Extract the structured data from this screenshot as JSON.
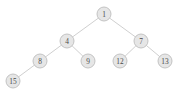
{
  "figure": {
    "type": "binary-tree-diagram",
    "background_color": "#ffffff",
    "node_fill_color": "#e6e6e6",
    "node_stroke_color": "#bdbdbd",
    "edge_color": "#c9c9c9",
    "label_color": "#4a4a4a"
  },
  "tree": {
    "root_id": "n1",
    "node_radius": 7,
    "nodes": [
      {
        "id": "n1",
        "label": "1",
        "x": 104,
        "y": 14,
        "depth": 0,
        "parent": null,
        "side": "root"
      },
      {
        "id": "n4",
        "label": "4",
        "x": 67,
        "y": 41,
        "depth": 1,
        "parent": "n1",
        "side": "left"
      },
      {
        "id": "n7",
        "label": "7",
        "x": 141,
        "y": 41,
        "depth": 1,
        "parent": "n1",
        "side": "right"
      },
      {
        "id": "n8",
        "label": "8",
        "x": 40,
        "y": 61,
        "depth": 2,
        "parent": "n4",
        "side": "left"
      },
      {
        "id": "n9",
        "label": "9",
        "x": 88,
        "y": 61,
        "depth": 2,
        "parent": "n4",
        "side": "right"
      },
      {
        "id": "n12",
        "label": "12",
        "x": 120,
        "y": 61,
        "depth": 2,
        "parent": "n7",
        "side": "left"
      },
      {
        "id": "n13",
        "label": "13",
        "x": 165,
        "y": 61,
        "depth": 2,
        "parent": "n7",
        "side": "right"
      },
      {
        "id": "n15",
        "label": "15",
        "x": 13,
        "y": 81,
        "depth": 3,
        "parent": "n8",
        "side": "left"
      }
    ],
    "edges": [
      {
        "id": "e1-4",
        "from": "n1",
        "to": "n4",
        "x1": 104,
        "y1": 14,
        "x2": 67,
        "y2": 41
      },
      {
        "id": "e1-7",
        "from": "n1",
        "to": "n7",
        "x1": 104,
        "y1": 14,
        "x2": 141,
        "y2": 41
      },
      {
        "id": "e4-8",
        "from": "n4",
        "to": "n8",
        "x1": 67,
        "y1": 41,
        "x2": 40,
        "y2": 61
      },
      {
        "id": "e4-9",
        "from": "n4",
        "to": "n9",
        "x1": 67,
        "y1": 41,
        "x2": 88,
        "y2": 61
      },
      {
        "id": "e7-12",
        "from": "n7",
        "to": "n12",
        "x1": 141,
        "y1": 41,
        "x2": 120,
        "y2": 61
      },
      {
        "id": "e7-13",
        "from": "n7",
        "to": "n13",
        "x1": 141,
        "y1": 41,
        "x2": 165,
        "y2": 61
      },
      {
        "id": "e8-15",
        "from": "n8",
        "to": "n15",
        "x1": 40,
        "y1": 61,
        "x2": 13,
        "y2": 81
      }
    ]
  }
}
